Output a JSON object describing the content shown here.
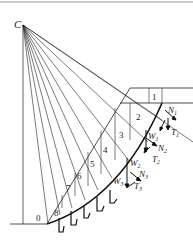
{
  "diagram": {
    "type": "slope-stability-method-of-slices",
    "center_label": "C",
    "toe_label": "0",
    "slices": [
      {
        "id": "1",
        "x": 155,
        "y": 97
      },
      {
        "id": "2",
        "x": 139,
        "y": 117
      },
      {
        "id": "3",
        "x": 122,
        "y": 135
      },
      {
        "id": "4",
        "x": 106,
        "y": 150
      },
      {
        "id": "5",
        "x": 93,
        "y": 164
      },
      {
        "id": "6",
        "x": 80,
        "y": 176
      },
      {
        "id": "7",
        "x": 69,
        "y": 188
      },
      {
        "id": "8",
        "x": 57,
        "y": 213
      }
    ],
    "force_labels": {
      "N1": {
        "base": "N",
        "sub": "1"
      },
      "T1": {
        "base": "T",
        "sub": "1"
      },
      "W1": {
        "base": "W",
        "sub": "1"
      },
      "N2": {
        "base": "N",
        "sub": "2"
      },
      "T2": {
        "base": "T",
        "sub": "2"
      },
      "W2": {
        "base": "W",
        "sub": "2"
      },
      "N3": {
        "base": "N",
        "sub": "3"
      },
      "T3": {
        "base": "T",
        "sub": "3"
      },
      "W3": {
        "base": "W",
        "sub": "3"
      }
    },
    "colors": {
      "line": "#222222",
      "background": "#ffffff"
    }
  }
}
